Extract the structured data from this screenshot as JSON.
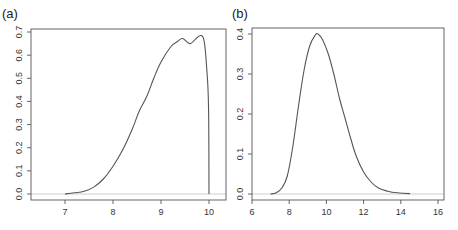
{
  "chart_data": [
    {
      "panel": "(a)",
      "type": "line",
      "title": "",
      "xlabel": "",
      "ylabel": "",
      "x_ticks": [
        7,
        8,
        9,
        10
      ],
      "y_ticks": [
        0.0,
        0.1,
        0.2,
        0.3,
        0.4,
        0.5,
        0.6,
        0.7
      ],
      "y_tick_labels": [
        "0.0",
        "0.1",
        "0.2",
        "0.3",
        "0.4",
        "0.5",
        "0.6",
        "0.7"
      ],
      "x_tick_labels": [
        "7",
        "8",
        "9",
        "10"
      ],
      "xlim": [
        6.3,
        10.35
      ],
      "ylim": [
        -0.025,
        0.715
      ],
      "grid": false,
      "baseline": 0.0,
      "series": [
        {
          "name": "density",
          "x": [
            7.0,
            7.2,
            7.4,
            7.6,
            7.8,
            8.0,
            8.2,
            8.4,
            8.55,
            8.7,
            8.85,
            9.0,
            9.2,
            9.35,
            9.45,
            9.6,
            9.7,
            9.82,
            9.9,
            9.95,
            9.99,
            10.0
          ],
          "y": [
            0.0,
            0.005,
            0.012,
            0.03,
            0.065,
            0.12,
            0.19,
            0.28,
            0.36,
            0.42,
            0.5,
            0.57,
            0.635,
            0.66,
            0.672,
            0.65,
            0.665,
            0.685,
            0.66,
            0.55,
            0.38,
            0.0
          ]
        }
      ]
    },
    {
      "panel": "(b)",
      "type": "line",
      "title": "",
      "xlabel": "",
      "ylabel": "",
      "x_ticks": [
        6,
        8,
        10,
        12,
        14,
        16
      ],
      "y_ticks": [
        0.0,
        0.1,
        0.2,
        0.3,
        0.4
      ],
      "y_tick_labels": [
        "0.0",
        "0.1",
        "0.2",
        "0.3",
        "0.4"
      ],
      "x_tick_labels": [
        "6",
        "8",
        "10",
        "12",
        "14",
        "16"
      ],
      "xlim": [
        6.0,
        16.3
      ],
      "ylim": [
        -0.015,
        0.415
      ],
      "grid": false,
      "baseline": 0.0,
      "series": [
        {
          "name": "density",
          "x": [
            7.0,
            7.3,
            7.6,
            7.9,
            8.2,
            8.5,
            8.8,
            9.1,
            9.4,
            9.55,
            9.8,
            10.1,
            10.4,
            10.7,
            11.0,
            11.3,
            11.6,
            12.0,
            12.4,
            12.8,
            13.3,
            13.8,
            14.5
          ],
          "y": [
            0.0,
            0.003,
            0.015,
            0.045,
            0.12,
            0.22,
            0.31,
            0.37,
            0.397,
            0.4,
            0.385,
            0.35,
            0.3,
            0.24,
            0.19,
            0.14,
            0.095,
            0.055,
            0.03,
            0.015,
            0.007,
            0.003,
            0.001
          ]
        }
      ]
    }
  ],
  "layout": [
    {
      "box": [
        31,
        29,
        226,
        200
      ],
      "x0": 7,
      "px0": 65,
      "x1": 10,
      "px1": 209,
      "y0": 0,
      "py0": 194,
      "y1": 0.7,
      "py1": 32,
      "label_pos": [
        2,
        18
      ]
    },
    {
      "box": [
        252,
        28,
        444,
        200
      ],
      "x0": 6,
      "px0": 252,
      "x1": 16,
      "px1": 438,
      "y0": 0,
      "py0": 194,
      "y1": 0.4,
      "py1": 34,
      "label_pos": [
        232,
        18
      ]
    }
  ]
}
